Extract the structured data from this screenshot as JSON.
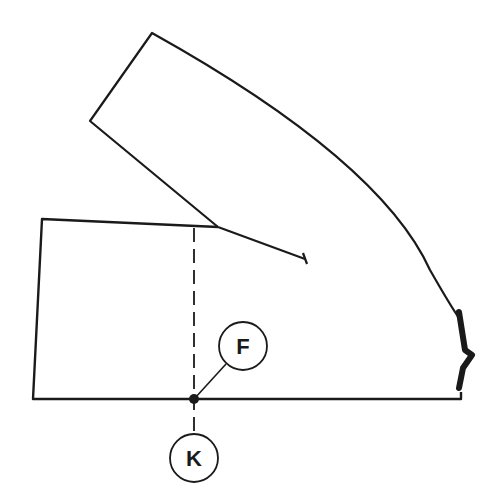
{
  "diagram": {
    "type": "pattern-drafting-diagram",
    "colors": {
      "line": "#1a1a1a",
      "background": "#ffffff"
    },
    "labels": {
      "point_f": "F",
      "point_k": "K"
    }
  }
}
